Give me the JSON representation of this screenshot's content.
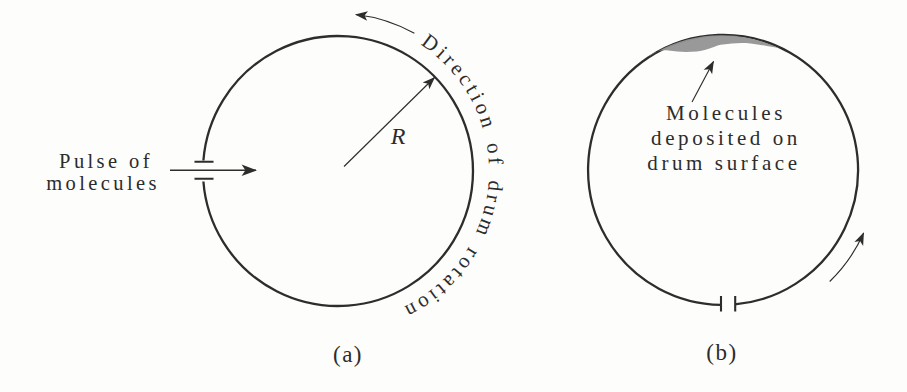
{
  "figure": {
    "colors": {
      "ink": "#2d2d2d",
      "deposit": "#949494",
      "background": "#fdfdfb"
    },
    "panel_a": {
      "caption": "(a)",
      "pulse_label_lines": [
        "Pulse of",
        "molecules"
      ],
      "radius_label": "R",
      "rotation_label": "Direction of drum rotation"
    },
    "panel_b": {
      "caption": "(b)",
      "deposit_label_lines": [
        "Molecules",
        "deposited on",
        "drum surface"
      ]
    }
  }
}
